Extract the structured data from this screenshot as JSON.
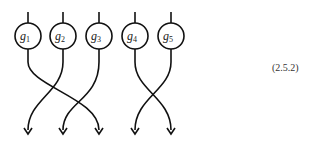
{
  "diagram": {
    "nodes": [
      {
        "id": "g1",
        "label": "g",
        "sub": "1",
        "cx": 28
      },
      {
        "id": "g2",
        "label": "g",
        "sub": "2",
        "cx": 63
      },
      {
        "id": "g3",
        "label": "g",
        "sub": "3",
        "cx": 99
      },
      {
        "id": "g4",
        "label": "g",
        "sub": "4",
        "cx": 135
      },
      {
        "id": "g5",
        "label": "g",
        "sub": "5",
        "cx": 171
      }
    ],
    "permutation": "g1→position3, g2→position1, g3→position2, g4→position5, g5→position4",
    "equation_label": "(2.5.2)"
  }
}
